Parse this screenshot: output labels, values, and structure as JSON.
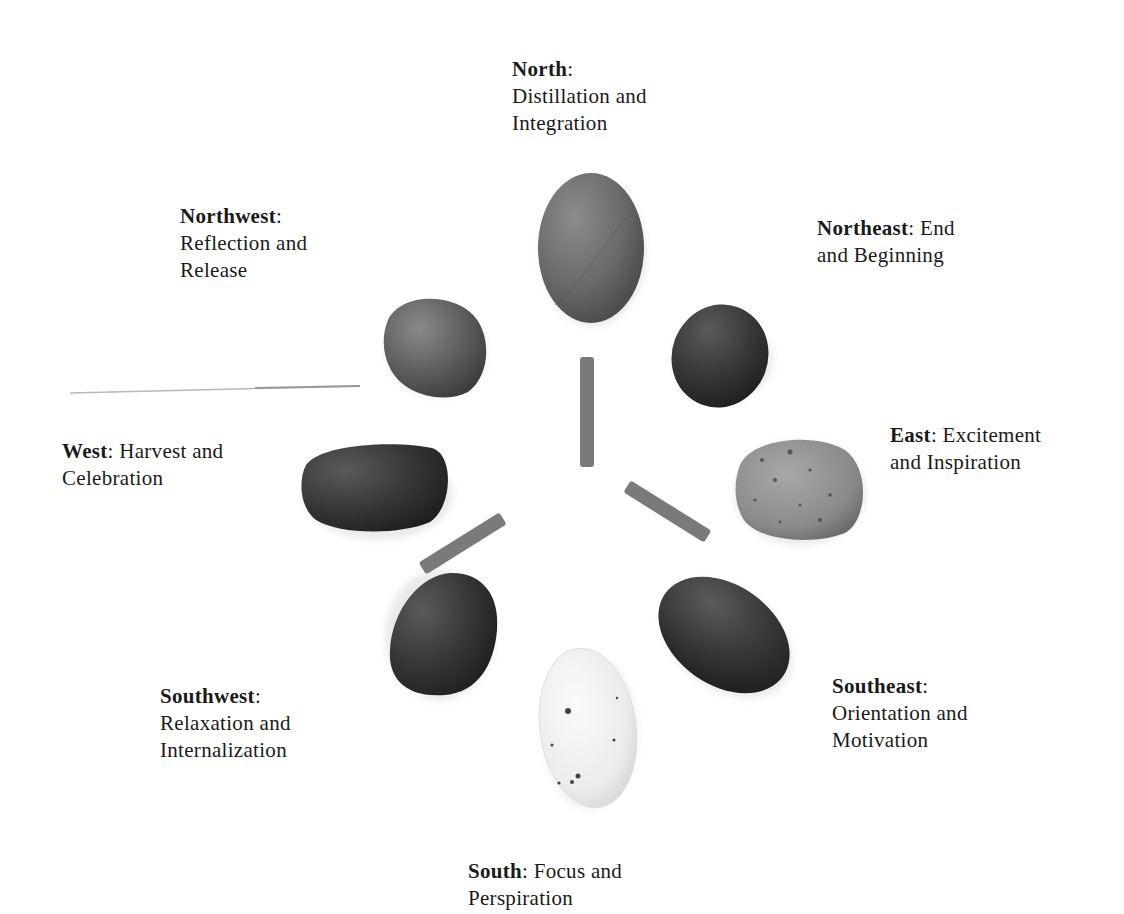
{
  "directions": [
    {
      "id": "north",
      "name": "North",
      "meaning_line1": "",
      "meaning_line2": "Distillation and",
      "meaning_line3": "Integration",
      "stone_color": "#6e6e6e"
    },
    {
      "id": "northeast",
      "name": "Northeast",
      "meaning_inline": " End",
      "meaning_line2": "and Beginning",
      "stone_color": "#3d3d3d"
    },
    {
      "id": "east",
      "name": "East",
      "meaning_inline": " Excitement",
      "meaning_line2": "and Inspiration",
      "stone_color": "#8a8a8a"
    },
    {
      "id": "southeast",
      "name": "Southeast",
      "meaning_line2": "Orientation and",
      "meaning_line3": "Motivation",
      "stone_color": "#353535"
    },
    {
      "id": "south",
      "name": "South",
      "meaning_inline": " Focus and",
      "meaning_line2": "Perspiration",
      "stone_color": "#ebebeb"
    },
    {
      "id": "southwest",
      "name": "Southwest",
      "meaning_line2": "Relaxation and",
      "meaning_line3": "Internalization",
      "stone_color": "#404040"
    },
    {
      "id": "west",
      "name": "West",
      "meaning_inline": " Harvest and",
      "meaning_line2": "Celebration",
      "stone_color": "#2c2c2c"
    },
    {
      "id": "northwest",
      "name": "Northwest",
      "meaning_line2": "Reflection and",
      "meaning_line3": "Release",
      "stone_color": "#5a5a5a"
    }
  ],
  "colon": ":",
  "center": {
    "description": "three twigs arranged in a Y shape",
    "twig_color": "#7a7a7a"
  }
}
